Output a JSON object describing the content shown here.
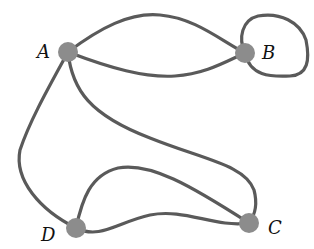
{
  "diagram": {
    "type": "multigraph",
    "nodes": [
      {
        "id": "A",
        "label": "A",
        "x": 68,
        "y": 52
      },
      {
        "id": "B",
        "label": "B",
        "x": 245,
        "y": 53
      },
      {
        "id": "C",
        "label": "C",
        "x": 249,
        "y": 223
      },
      {
        "id": "D",
        "label": "D",
        "x": 76,
        "y": 228
      }
    ],
    "edges": [
      {
        "from": "A",
        "to": "B",
        "kind": "upper-arc"
      },
      {
        "from": "A",
        "to": "B",
        "kind": "lower-arc"
      },
      {
        "from": "B",
        "to": "B",
        "kind": "loop"
      },
      {
        "from": "A",
        "to": "D",
        "kind": "curve"
      },
      {
        "from": "A",
        "to": "C",
        "kind": "curve"
      },
      {
        "from": "D",
        "to": "C",
        "kind": "upper-arc"
      },
      {
        "from": "D",
        "to": "C",
        "kind": "lower-arc"
      }
    ],
    "colors": {
      "edge": "#5a5a5a",
      "node": "#8c8c8c",
      "label": "#111111"
    }
  }
}
